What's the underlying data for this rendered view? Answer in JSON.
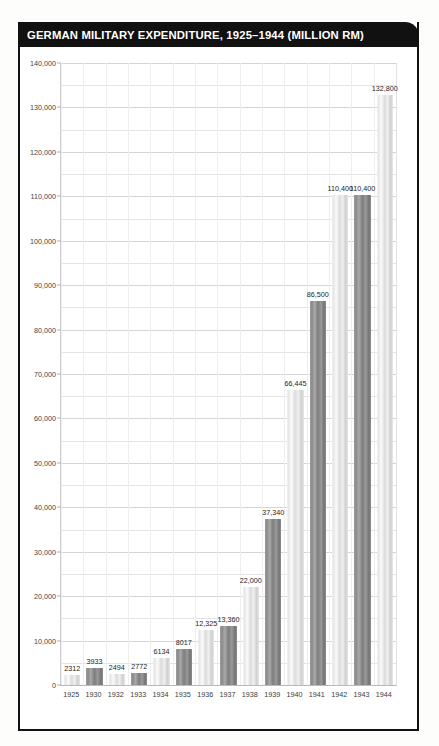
{
  "title": "GERMAN MILITARY EXPENDITURE, 1925–1944 (MILLION RM)",
  "colors": {
    "title_bar": "#111111",
    "title_text": "#ffffff",
    "bar_light": "#e8e8e8",
    "bar_dark": "#8a8a8a",
    "gridline": "#e4e4e4",
    "frame": "#111111"
  },
  "chart_data": {
    "type": "bar",
    "title": "GERMAN MILITARY EXPENDITURE, 1925–1944 (MILLION RM)",
    "xlabel": "",
    "ylabel": "",
    "ylim": [
      0,
      140000
    ],
    "ytick_step": 10000,
    "grid": true,
    "legend": "none",
    "categories": [
      "1925",
      "1930",
      "1932",
      "1933",
      "1934",
      "1935",
      "1936",
      "1937",
      "1938",
      "1939",
      "1940",
      "1941",
      "1942",
      "1943",
      "1944"
    ],
    "values": [
      2312,
      3933,
      2494,
      2772,
      6134,
      8017,
      12325,
      13360,
      22000,
      37340,
      66445,
      86500,
      110400,
      110400,
      132800
    ],
    "value_labels": [
      "2312",
      "3933",
      "2494",
      "2772",
      "6134",
      "8017",
      "12,325",
      "13,360",
      "22,000",
      "37,340",
      "66,445",
      "86,500",
      "110,400",
      "110,400",
      "132,800"
    ],
    "ytick_labels": [
      "0",
      "10,000",
      "20,000",
      "30,000",
      "40,000",
      "50,000",
      "60,000",
      "70,000",
      "80,000",
      "90,000",
      "100,000",
      "110,000",
      "120,000",
      "130,000",
      "140,000"
    ],
    "ytick_values": [
      0,
      10000,
      20000,
      30000,
      40000,
      50000,
      60000,
      70000,
      80000,
      90000,
      100000,
      110000,
      120000,
      130000,
      140000
    ],
    "bar_styles": [
      "light",
      "dark",
      "light",
      "dark",
      "light",
      "dark",
      "light",
      "dark",
      "light",
      "dark",
      "light",
      "dark",
      "light",
      "dark",
      "light"
    ]
  }
}
